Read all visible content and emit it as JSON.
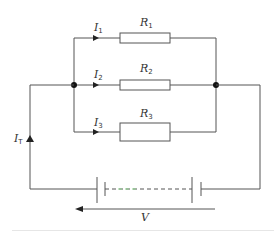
{
  "diagram": {
    "colors": {
      "wire": "#555555",
      "node": "#111111",
      "text": "#333333",
      "dash_highlight": "#8fd68f"
    },
    "resistors": [
      {
        "label": "R",
        "subscript": "1"
      },
      {
        "label": "R",
        "subscript": "2"
      },
      {
        "label": "R",
        "subscript": "3"
      }
    ],
    "branch_currents": [
      {
        "label": "I",
        "subscript": "1"
      },
      {
        "label": "I",
        "subscript": "2"
      },
      {
        "label": "I",
        "subscript": "3"
      }
    ],
    "total_current": {
      "label": "I",
      "subscript": "T"
    },
    "voltage": {
      "label": "V"
    }
  }
}
